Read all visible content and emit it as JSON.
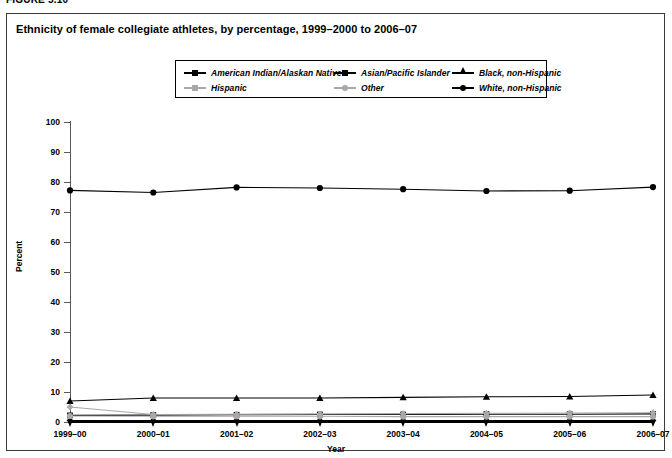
{
  "figure": {
    "number_label": "FIGURE 5.10",
    "title": "Ethnicity of female collegiate athletes, by percentage, 1999–2000 to 2006–07"
  },
  "legend": {
    "items": [
      {
        "label": "American Indian/Alaskan Native",
        "marker": "diamond",
        "color": "#000000"
      },
      {
        "label": "Asian/Pacific Islander",
        "marker": "square",
        "color": "#000000"
      },
      {
        "label": "Black, non-Hispanic",
        "marker": "triangle",
        "color": "#000000"
      },
      {
        "label": "Hispanic",
        "marker": "diamond",
        "color": "#a8a8a8"
      },
      {
        "label": "Other",
        "marker": "circle",
        "color": "#a8a8a8"
      },
      {
        "label": "White, non-Hispanic",
        "marker": "circle",
        "color": "#000000"
      }
    ]
  },
  "chart_data": {
    "type": "line",
    "title": "Ethnicity of female collegiate athletes, by percentage, 1999–2000 to 2006–07",
    "xlabel": "Year",
    "ylabel": "Percent",
    "categories": [
      "1999–00",
      "2000–01",
      "2001–02",
      "2002–03",
      "2003–04",
      "2004–05",
      "2005–06",
      "2006–07"
    ],
    "ylim": [
      0,
      100
    ],
    "yticks": [
      0,
      10,
      20,
      30,
      40,
      50,
      60,
      70,
      80,
      90,
      100
    ],
    "grid": false,
    "legend_position": "top-center",
    "series": [
      {
        "name": "American Indian/Alaskan Native",
        "marker": "diamond",
        "color": "#000000",
        "values": [
          0.5,
          0.5,
          0.5,
          0.5,
          0.5,
          0.5,
          0.5,
          0.5
        ]
      },
      {
        "name": "Asian/Pacific Islander",
        "marker": "square",
        "color": "#000000",
        "values": [
          2.2,
          2.3,
          2.4,
          2.5,
          2.5,
          2.6,
          2.6,
          2.7
        ]
      },
      {
        "name": "Black, non-Hispanic",
        "marker": "triangle",
        "color": "#000000",
        "values": [
          7.0,
          8.0,
          8.0,
          8.0,
          8.2,
          8.4,
          8.5,
          9.0
        ]
      },
      {
        "name": "Hispanic",
        "marker": "diamond",
        "color": "#a8a8a8",
        "values": [
          5.0,
          2.5,
          2.6,
          2.7,
          2.8,
          2.9,
          3.0,
          3.1
        ]
      },
      {
        "name": "Other",
        "marker": "circle",
        "color": "#a8a8a8",
        "values": [
          2.0,
          1.9,
          1.9,
          1.9,
          1.8,
          1.8,
          1.8,
          1.8
        ]
      },
      {
        "name": "White, non-Hispanic",
        "marker": "circle",
        "color": "#000000",
        "values": [
          77.2,
          76.5,
          78.2,
          78.0,
          77.6,
          77.0,
          77.1,
          78.3
        ]
      }
    ]
  }
}
